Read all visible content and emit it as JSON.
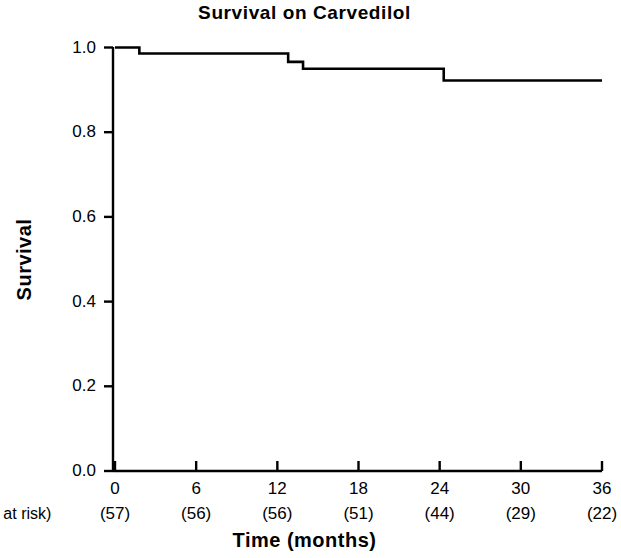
{
  "chart_data": {
    "type": "line",
    "subtype": "kaplan-meier-step",
    "title": "Survival on Carvedilol",
    "xlabel": "Time  (months)",
    "ylabel": "Survival",
    "xlim": [
      0,
      36
    ],
    "ylim": [
      0.0,
      1.0
    ],
    "grid": false,
    "legend": null,
    "x_ticks": [
      0,
      6,
      12,
      18,
      24,
      30,
      36
    ],
    "x_tick_labels": [
      "0",
      "6",
      "12",
      "18",
      "24",
      "30",
      "36"
    ],
    "y_ticks": [
      0.0,
      0.2,
      0.4,
      0.6,
      0.8,
      1.0
    ],
    "y_tick_labels": [
      "0.0",
      "0.2",
      "0.4",
      "0.6",
      "0.8",
      "1.0"
    ],
    "at_risk_label": "# at risk)",
    "at_risk_labels": [
      "(57)",
      "(56)",
      "(56)",
      "(51)",
      "(44)",
      "(29)",
      "(22)"
    ],
    "at_risk_values": [
      57,
      56,
      56,
      51,
      44,
      29,
      22
    ],
    "line_color": "#000000",
    "series": [
      {
        "name": "Survival on Carvedilol",
        "step_points": [
          {
            "x": 0.0,
            "y": 1.0
          },
          {
            "x": 1.8,
            "y": 1.0
          },
          {
            "x": 1.8,
            "y": 0.986
          },
          {
            "x": 12.8,
            "y": 0.986
          },
          {
            "x": 12.8,
            "y": 0.966
          },
          {
            "x": 13.9,
            "y": 0.966
          },
          {
            "x": 13.9,
            "y": 0.95
          },
          {
            "x": 24.3,
            "y": 0.95
          },
          {
            "x": 24.3,
            "y": 0.922
          },
          {
            "x": 36.0,
            "y": 0.922
          }
        ],
        "event_times": [
          1.8,
          12.8,
          13.9,
          24.3
        ],
        "survival_after_event": [
          0.986,
          0.966,
          0.95,
          0.922
        ]
      }
    ]
  }
}
